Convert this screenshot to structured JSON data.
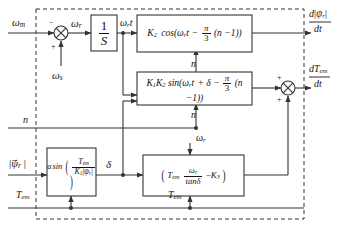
{
  "diagram": {
    "type": "control-block-diagram",
    "boundary": "dashed",
    "line_color": "#333333",
    "bg_color": "#ffffff"
  },
  "inputs": {
    "omega_m": "ω",
    "omega_m_sub": "m",
    "omega_s": "ω",
    "omega_s_sub": "s",
    "n": "n",
    "psi_r": "ψ",
    "psi_r_sub": "r",
    "psi_r_bars": "| |",
    "t_em": "T",
    "t_em_sub": "em"
  },
  "signals": {
    "omega_r": "ω",
    "omega_r_sub": "r",
    "omega_r_t": "ω",
    "omega_r_t_sub": "r",
    "omega_r_t_suffix": "t",
    "delta": "δ",
    "n_top": "n",
    "n_bottom": "n",
    "n_bus": "n",
    "t_em_bus": "T",
    "t_em_bus_sub": "em"
  },
  "summing_junctions": [
    {
      "name": "speed-error-sum",
      "signs": [
        "−",
        "+"
      ],
      "output": "ωr"
    },
    {
      "name": "torque-derivative-sum",
      "signs": [
        "+",
        "+"
      ],
      "output": "dTem/dt"
    }
  ],
  "blocks": {
    "integrator": {
      "name": "integrator",
      "numerator": "1",
      "denominator": "S"
    },
    "cosine": {
      "name": "cosine-block",
      "k": "K",
      "k_sub": "2",
      "fn": "cos(",
      "omega": "ω",
      "omega_sub": "r",
      "t": "t",
      "minus": "−",
      "pi": "π",
      "three": "3",
      "tail": "(n −1))"
    },
    "sine": {
      "name": "sine-block",
      "k1": "K",
      "k1_sub": "1",
      "k2": "K",
      "k2_sub": "2",
      "fn": "sin(",
      "omega": "ω",
      "omega_sub": "r",
      "t": "t",
      "plus_delta": "+ δ",
      "minus": "−",
      "pi": "π",
      "three": "3",
      "tail": "(n −1))"
    },
    "arcsine": {
      "name": "arcsine-block",
      "prefix": "a",
      "fn": "sin",
      "num": "T",
      "num_sub": "em",
      "den_k": "K",
      "den_k_sub": "1",
      "den_psi": "ψ",
      "den_psi_sub": "r"
    },
    "torque_speed": {
      "name": "torque-speed-block",
      "t_em": "T",
      "t_em_sub": "em",
      "omega": "ω",
      "omega_sub": "r",
      "tan": "tan",
      "delta": "δ",
      "minus": "−",
      "k3": "K",
      "k3_sub": "3"
    }
  },
  "outputs": {
    "flux_derivative": {
      "name": "flux-derivative-output",
      "num_d": "d",
      "num_psi": "ψ",
      "num_psi_sub": "r",
      "den": "dt"
    },
    "torque_derivative": {
      "name": "torque-derivative-output",
      "num_d": "dT",
      "num_sub": "em",
      "den": "dt"
    }
  }
}
